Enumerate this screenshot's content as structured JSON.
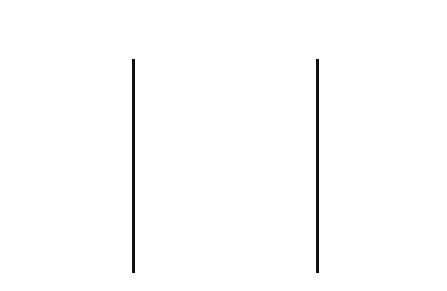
{
  "figure": {
    "kind": "diagram"
  },
  "well": {
    "segment_count": 11,
    "line_count": 12,
    "line_color": "#111111",
    "fill_color": "#ffffff",
    "box_left_px": 132,
    "box_right_px": 319,
    "box_top_px": 59,
    "box_bottom_px": 273
  },
  "annotations": [
    {
      "id": "day-8",
      "label": "Day 8",
      "side": "right",
      "line_index": 0,
      "y_px": 60,
      "arrow": "points-left-to-well"
    },
    {
      "id": "day-2",
      "label": "Day 2",
      "side": "right",
      "line_index": 6,
      "y_px": 186,
      "arrow": "points-left-to-well"
    },
    {
      "id": "day-1",
      "label": "Day 1",
      "side": "right",
      "line_index": 7,
      "y_px": 208,
      "arrow": "points-left-to-well"
    },
    {
      "id": "night-2",
      "label": "Night 2",
      "side": "left",
      "line_index": 8,
      "y_px": 229,
      "arrow": "points-right-to-well"
    },
    {
      "id": "night-1",
      "label": "Night 1",
      "side": "left",
      "line_index": 9,
      "y_px": 251,
      "arrow": "points-right-to-well"
    }
  ]
}
